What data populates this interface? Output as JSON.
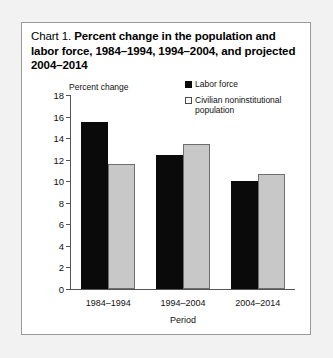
{
  "card": {
    "title_prefix": "Chart 1.",
    "title_main": "Percent change in the population and labor force, 1984–1994, 1994–2004, and projected 2004–2014"
  },
  "colors": {
    "labor_force": "#0a0a0a",
    "civilian_population": "#c8c8c8",
    "axis": "#555555",
    "border": "#9a9a9a",
    "background": "#ffffff"
  },
  "legend": {
    "position": "top-right",
    "items": [
      {
        "label": "Labor force",
        "swatch": "filled-square"
      },
      {
        "label": "Civilian noninstitutional population",
        "swatch": "outlined-square"
      }
    ]
  },
  "chart_data": {
    "type": "bar",
    "title": "Percent change in the population and labor force, 1984–1994, 1994–2004, and projected 2004–2014",
    "categories": [
      "1984–1994",
      "1994–2004",
      "2004–2014"
    ],
    "series": [
      {
        "name": "Labor force",
        "values": [
          15.5,
          12.4,
          10.0
        ]
      },
      {
        "name": "Civilian noninstitutional population",
        "values": [
          11.6,
          13.5,
          10.7
        ]
      }
    ],
    "xlabel": "Period",
    "ylabel": "Percent change",
    "ylim": [
      0,
      18
    ],
    "ytick_step": 2,
    "yticks": [
      0,
      2,
      4,
      6,
      8,
      10,
      12,
      14,
      16,
      18
    ],
    "ytick_labels": [
      "0",
      "2",
      "4",
      "6",
      "8",
      "10",
      "12",
      "14",
      "16",
      "18"
    ],
    "grid": false,
    "legend_position": "top-right"
  }
}
